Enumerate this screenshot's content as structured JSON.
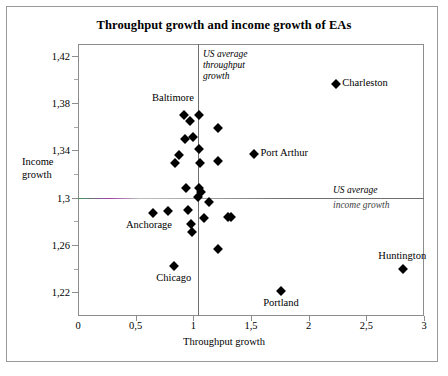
{
  "chart_data": {
    "type": "scatter",
    "title": "Throughput growth and income growth of EAs",
    "xlabel": "Throughput growth",
    "ylabel": "Income\ngrowth",
    "ylabel_line1": "Income",
    "ylabel_line2": "growth",
    "xlim": [
      0,
      3
    ],
    "ylim": [
      1.2,
      1.43
    ],
    "xticks": [
      "0",
      "0,5",
      "1",
      "1,5",
      "2",
      "2,5",
      "3"
    ],
    "xtick_values": [
      0,
      0.5,
      1,
      1.5,
      2,
      2.5,
      3
    ],
    "yticks": [
      "1,42",
      "1,38",
      "1,34",
      "1,3",
      "1,26",
      "1,22"
    ],
    "ytick_values": [
      1.42,
      1.38,
      1.34,
      1.3,
      1.26,
      1.22
    ],
    "grid": false,
    "legend": "none",
    "marker": "filled-diamond",
    "marker_color": "#000000",
    "reference_lines": [
      {
        "name": "us-average-throughput-growth",
        "orientation": "vertical",
        "value": 1.04,
        "label": "US average\nthroughput\ngrowth",
        "label_lines": [
          "US average",
          "throughput",
          "growth"
        ],
        "color": "#6f6f6f"
      },
      {
        "name": "us-average-income-growth",
        "orientation": "horizontal",
        "value": 1.3,
        "label": "US average\nincome growth",
        "label_lines": [
          "US average",
          "income growth"
        ],
        "color": "#6f6f6f"
      }
    ],
    "points": [
      {
        "x": 2.24,
        "y": 1.396,
        "label": "Charleston",
        "label_pos": "right"
      },
      {
        "x": 0.92,
        "y": 1.37,
        "label": "",
        "label_pos": ""
      },
      {
        "x": 1.05,
        "y": 1.37,
        "label": "",
        "label_pos": ""
      },
      {
        "x": 0.97,
        "y": 1.365,
        "label": "",
        "label_pos": ""
      },
      {
        "x": 1.21,
        "y": 1.359,
        "label": "",
        "label_pos": ""
      },
      {
        "x": 0.93,
        "y": 1.35,
        "label": "",
        "label_pos": ""
      },
      {
        "x": 1.0,
        "y": 1.351,
        "label": "",
        "label_pos": ""
      },
      {
        "x": 1.05,
        "y": 1.341,
        "label": "",
        "label_pos": ""
      },
      {
        "x": 1.53,
        "y": 1.337,
        "label": "Port Arthur",
        "label_pos": "right"
      },
      {
        "x": 0.88,
        "y": 1.336,
        "label": "",
        "label_pos": ""
      },
      {
        "x": 0.84,
        "y": 1.329,
        "label": "",
        "label_pos": ""
      },
      {
        "x": 1.21,
        "y": 1.331,
        "label": "",
        "label_pos": ""
      },
      {
        "x": 1.06,
        "y": 1.329,
        "label": "",
        "label_pos": ""
      },
      {
        "x": 1.05,
        "y": 1.308,
        "label": "",
        "label_pos": ""
      },
      {
        "x": 1.07,
        "y": 1.305,
        "label": "",
        "label_pos": ""
      },
      {
        "x": 0.94,
        "y": 1.308,
        "label": "",
        "label_pos": ""
      },
      {
        "x": 1.04,
        "y": 1.301,
        "label": "",
        "label_pos": ""
      },
      {
        "x": 1.14,
        "y": 1.296,
        "label": "",
        "label_pos": ""
      },
      {
        "x": 0.95,
        "y": 1.29,
        "label": "",
        "label_pos": ""
      },
      {
        "x": 0.78,
        "y": 1.289,
        "label": "",
        "label_pos": ""
      },
      {
        "x": 0.65,
        "y": 1.287,
        "label": "Anchorage",
        "label_pos": "below-left"
      },
      {
        "x": 1.09,
        "y": 1.283,
        "label": "",
        "label_pos": ""
      },
      {
        "x": 1.3,
        "y": 1.284,
        "label": "",
        "label_pos": ""
      },
      {
        "x": 1.33,
        "y": 1.284,
        "label": "",
        "label_pos": ""
      },
      {
        "x": 0.98,
        "y": 1.278,
        "label": "",
        "label_pos": ""
      },
      {
        "x": 0.99,
        "y": 1.271,
        "label": "",
        "label_pos": ""
      },
      {
        "x": 1.21,
        "y": 1.257,
        "label": "",
        "label_pos": ""
      },
      {
        "x": 0.83,
        "y": 1.242,
        "label": "Chicago",
        "label_pos": "below"
      },
      {
        "x": 2.82,
        "y": 1.24,
        "label": "Huntington",
        "label_pos": "above"
      },
      {
        "x": 1.76,
        "y": 1.221,
        "label": "Portland",
        "label_pos": "below"
      }
    ]
  }
}
